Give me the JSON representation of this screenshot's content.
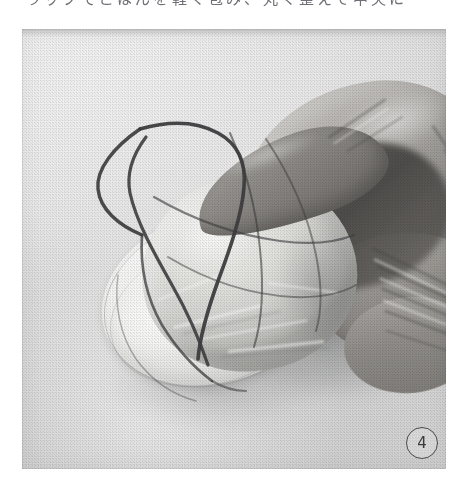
{
  "page": {
    "background_color": "#ffffff",
    "width": 463,
    "height": 479
  },
  "caption": {
    "text": "ラップでごはんを軽く包み、丸く整えて中央に",
    "note": "cropped top line of Japanese body text",
    "color": "#6e7076"
  },
  "photo": {
    "type": "black-and-white halftone photograph",
    "alt": "A hand holding a plastic-wrapped rice ball with dark thread wrapped around it in a grid pattern, resting on a white dish",
    "background_color": "#e6e7e6",
    "subjects": {
      "hand": {
        "label": "hand",
        "description": "right hand gripping the wrapped ball from above and the right side",
        "tone": "#9c9995"
      },
      "ball": {
        "label": "wrapped rice ball",
        "description": "round pale ball covered in clear plastic wrap",
        "tone": "#e0e0dd"
      },
      "thread": {
        "label": "thread",
        "description": "dark thread/string wound over the ball in intersecting loops",
        "color": "#403f40"
      },
      "dish": {
        "label": "white dish",
        "description": "round white plate beneath the ball",
        "tone": "#f6f6f5"
      }
    }
  },
  "step_badge": {
    "number": "4",
    "shape": "circled-number",
    "color": "#3b3b3d"
  }
}
